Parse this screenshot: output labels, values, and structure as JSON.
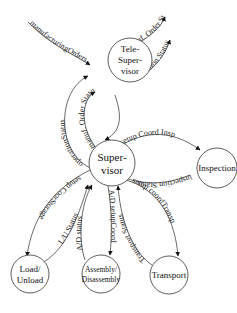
{
  "diagram": {
    "type": "state-transition / control flow diagram",
    "nodes": [
      {
        "id": "tele-supervisor",
        "lines": [
          "Tele-",
          "Super-",
          "visor"
        ]
      },
      {
        "id": "supervisor",
        "lines": [
          "Super-",
          "visor"
        ]
      },
      {
        "id": "inspection",
        "lines": [
          "Inspection"
        ]
      },
      {
        "id": "load-unload",
        "lines": [
          "Load/",
          "Unload"
        ]
      },
      {
        "id": "assembly-disassembly",
        "lines": [
          "Assembly/",
          "Disassembly"
        ]
      },
      {
        "id": "transport",
        "lines": [
          "Transport"
        ]
      }
    ],
    "edges": [
      {
        "id": "e1",
        "label": "manufacturingOrders",
        "from": "external",
        "to": "tele-supervisor"
      },
      {
        "id": "e2",
        "label": "manuf. Order Status",
        "from": "tele-supervisor",
        "to": "external"
      },
      {
        "id": "e3",
        "label": "operation Status",
        "from": "tele-supervisor",
        "to": "external"
      },
      {
        "id": "e4",
        "label": "operationStatus",
        "from": "supervisor",
        "to": "tele-supervisor"
      },
      {
        "id": "e5",
        "label": "manuf. Order Status",
        "from": "supervisor",
        "to": "tele-supervisor"
      },
      {
        "id": "e6",
        "label": "",
        "from": "tele-supervisor",
        "to": "supervisor"
      },
      {
        "id": "e7",
        "label": "setup Coord Insp",
        "from": "supervisor",
        "to": "inspection"
      },
      {
        "id": "e8",
        "label": "inspection Status",
        "from": "inspection",
        "to": "supervisor"
      },
      {
        "id": "e9",
        "label": "setup CoorStorage",
        "from": "supervisor",
        "to": "load-unload"
      },
      {
        "id": "e10",
        "label": "L/U Status",
        "from": "load-unload",
        "to": "supervisor"
      },
      {
        "id": "e11",
        "label": "A/D status",
        "from": "assembly-disassembly",
        "to": "supervisor"
      },
      {
        "id": "e12",
        "label": "A/D setupCoord",
        "from": "supervisor",
        "to": "assembly-disassembly"
      },
      {
        "id": "e13",
        "label": "Transport Status",
        "from": "transport",
        "to": "supervisor"
      },
      {
        "id": "e14",
        "label": "setup coordTransp",
        "from": "supervisor",
        "to": "transport"
      }
    ]
  }
}
